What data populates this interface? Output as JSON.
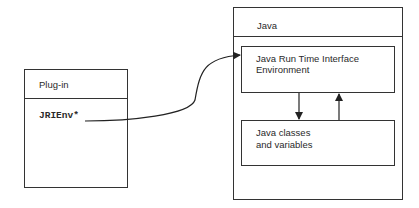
{
  "diagram": {
    "plugin_box": {
      "title": "Plug-in",
      "content": "JRIEnv*"
    },
    "java_box": {
      "title": "Java",
      "jri_box": {
        "line1": "Java Run Time Interface",
        "line2": "Environment"
      },
      "classes_box": {
        "line1": "Java classes",
        "line2": "and variables"
      }
    },
    "connections": [
      {
        "from": "JRIEnv*",
        "to": "Java Run Time Interface Environment",
        "style": "curved-arrow"
      },
      {
        "from": "Java Run Time Interface Environment",
        "to": "Java classes and variables",
        "style": "arrow-down"
      },
      {
        "from": "Java classes and variables",
        "to": "Java Run Time Interface Environment",
        "style": "arrow-up"
      }
    ],
    "colors": {
      "line": "#333333",
      "background": "#ffffff"
    }
  }
}
